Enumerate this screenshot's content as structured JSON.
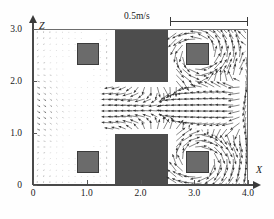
{
  "figure": {
    "type": "velocity-vector-field",
    "x_axis": {
      "label": "X",
      "ticks": [
        "0",
        "1.0",
        "2.0",
        "3.0",
        "4.0"
      ],
      "values": [
        0,
        1.0,
        2.0,
        3.0,
        4.0
      ],
      "min": 0,
      "max": 4.0
    },
    "z_axis": {
      "label": "Z",
      "ticks": [
        "0",
        "1.0",
        "2.0",
        "3.0"
      ],
      "values": [
        0,
        1.0,
        2.0,
        3.0
      ],
      "min": 0,
      "max": 3.0
    },
    "scale_bar": {
      "label": "0.5m/s",
      "value": 0.5,
      "units": "m/s"
    }
  },
  "blocks": {
    "large": [
      {
        "name": "upper-center-block",
        "x0": 1.5,
        "x1": 2.5,
        "z0": 2.0,
        "z1": 3.0
      },
      {
        "name": "lower-center-block",
        "x0": 1.5,
        "x1": 2.5,
        "z0": 0.0,
        "z1": 1.0
      }
    ],
    "small": [
      {
        "name": "upper-left-block",
        "x0": 0.8,
        "x1": 1.2,
        "z0": 2.32,
        "z1": 2.76
      },
      {
        "name": "lower-left-block",
        "x0": 0.8,
        "x1": 1.2,
        "z0": 0.28,
        "z1": 0.72
      },
      {
        "name": "upper-right-block",
        "x0": 2.82,
        "x1": 3.25,
        "z0": 2.32,
        "z1": 2.76
      },
      {
        "name": "lower-right-block",
        "x0": 2.82,
        "x1": 3.25,
        "z0": 0.28,
        "z1": 0.72
      }
    ]
  },
  "colors": {
    "large_block": "#4d4d4d",
    "small_block": "#6b6b6b",
    "small_block_border": "#3b3b3b",
    "frame": "#6d6d6d",
    "axis": "#4a4a4a",
    "vector": "#2f2f2f",
    "background": "#ffffff"
  },
  "chart_data": {
    "type": "scatter",
    "title": "",
    "xlabel": "X",
    "ylabel": "Z",
    "xlim": [
      0,
      4.0
    ],
    "ylim": [
      0,
      3.0
    ],
    "grid": false,
    "legend": "none",
    "annotations": [
      "0.5m/s"
    ],
    "vector_grid": {
      "nx": 34,
      "nz": 26,
      "dx": 0.1176,
      "dz": 0.1154
    },
    "reference_vector_length_px": 78,
    "reference_vector_speed": 0.5
  }
}
